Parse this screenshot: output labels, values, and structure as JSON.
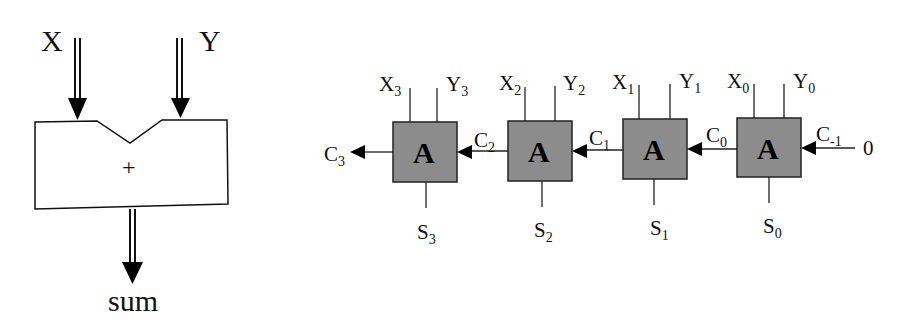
{
  "single_adder": {
    "input_x": "X",
    "input_y": "Y",
    "operator": "+",
    "output": "sum"
  },
  "ripple_carry_adder": {
    "block_label": "A",
    "block_fill": "#8c8c8c",
    "carry_in_value": "0",
    "carry_out": {
      "base": "C",
      "sub": "3"
    },
    "stages": [
      {
        "x": {
          "base": "X",
          "sub": "3"
        },
        "y": {
          "base": "Y",
          "sub": "3"
        },
        "s": {
          "base": "S",
          "sub": "3"
        },
        "cin": {
          "base": "C",
          "sub": "2"
        }
      },
      {
        "x": {
          "base": "X",
          "sub": "2"
        },
        "y": {
          "base": "Y",
          "sub": "2"
        },
        "s": {
          "base": "S",
          "sub": "2"
        },
        "cin": {
          "base": "C",
          "sub": "1"
        }
      },
      {
        "x": {
          "base": "X",
          "sub": "1"
        },
        "y": {
          "base": "Y",
          "sub": "1"
        },
        "s": {
          "base": "S",
          "sub": "1"
        },
        "cin": {
          "base": "C",
          "sub": "0"
        }
      },
      {
        "x": {
          "base": "X",
          "sub": "0"
        },
        "y": {
          "base": "Y",
          "sub": "0"
        },
        "s": {
          "base": "S",
          "sub": "0"
        },
        "cin": {
          "base": "C",
          "sub": "-1"
        }
      }
    ]
  }
}
